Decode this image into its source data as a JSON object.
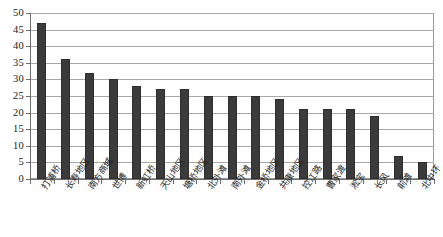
{
  "chart_data": {
    "type": "bar",
    "title": "",
    "subtitle": "",
    "xlabel": "",
    "ylabel": "",
    "ylim": [
      0,
      50
    ],
    "yticks": [
      0,
      5,
      10,
      15,
      20,
      25,
      30,
      35,
      40,
      45,
      50
    ],
    "ytick_labels": [
      "0",
      "5",
      "10",
      "15",
      "20",
      "25",
      "30",
      "35",
      "40",
      "45",
      "50"
    ],
    "grid": true,
    "grid_axis": "y",
    "legend": false,
    "legend_position": "none",
    "bar_color": "#3b3b3b",
    "plot_background": "#ffffff",
    "grid_color": "#a8a8a8",
    "axis_color": "#6e6e6e",
    "categories": [
      "打浦桥",
      "长寿地区",
      "南方商城",
      "世博",
      "新虹桥",
      "天山地区",
      "塘桥地区",
      "北外滩",
      "南外滩",
      "金桥地区",
      "共康地区",
      "控江路",
      "曹家渡",
      "淞宝",
      "长风",
      "前滩",
      "北中环"
    ],
    "values": [
      47,
      36,
      32,
      30,
      28,
      27,
      27,
      25,
      25,
      25,
      24,
      21,
      21,
      21,
      19,
      7,
      5
    ]
  }
}
